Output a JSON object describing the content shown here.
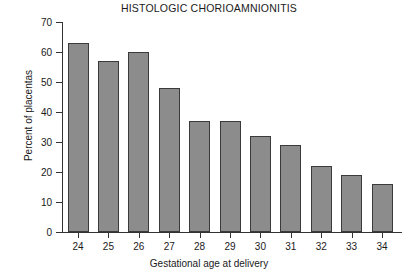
{
  "chart_data": {
    "type": "bar",
    "title": "HISTOLOGIC CHORIOAMNIONITIS",
    "xlabel": "Gestational age at delivery",
    "ylabel": "Percent of placentas",
    "categories": [
      "24",
      "25",
      "26",
      "27",
      "28",
      "29",
      "30",
      "31",
      "32",
      "33",
      "34"
    ],
    "values": [
      63,
      57,
      60,
      48,
      37,
      37,
      32,
      29,
      22,
      19,
      16
    ],
    "ylim": [
      0,
      70
    ],
    "yticks": [
      0,
      10,
      20,
      30,
      40,
      50,
      60,
      70
    ],
    "ytick_labels": [
      "0",
      "10",
      "20",
      "30",
      "40",
      "50",
      "60",
      "70"
    ],
    "grid": false,
    "legend": "none",
    "bar_color": "#8c8c8c",
    "bar_edge_color": "#3a3a3a",
    "axis_color": "#333333",
    "background_color": "#ffffff"
  }
}
